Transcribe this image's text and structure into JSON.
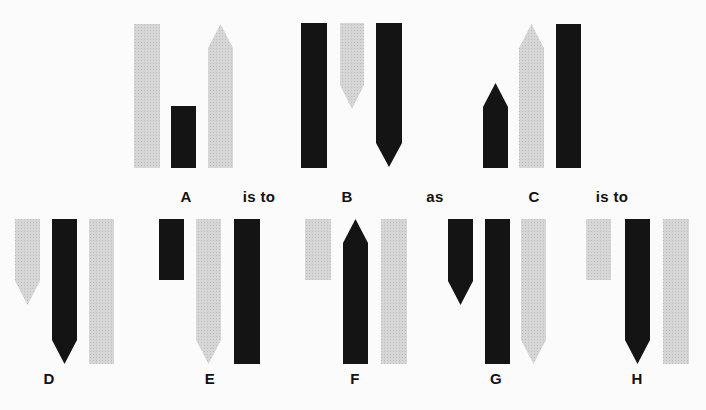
{
  "colors": {
    "dark": "#141414",
    "light": "#d2d2d2",
    "background": "#fbfbfb"
  },
  "puzzle": {
    "type": "visual-analogy",
    "statement": [
      "A",
      "is to",
      "B",
      "as",
      "C",
      "is to"
    ],
    "connectors": {
      "first": "is to",
      "middle": "as",
      "last": "is to"
    },
    "panels": [
      {
        "id": "A",
        "label": "A",
        "row": "question",
        "label_x": 186,
        "label_y": 188,
        "bars": [
          {
            "color": "light",
            "x": 134,
            "w": 26,
            "top": 24,
            "bottom": 168,
            "point": "none"
          },
          {
            "color": "dark",
            "x": 171,
            "w": 25,
            "top": 106,
            "bottom": 168,
            "point": "none"
          },
          {
            "color": "light",
            "x": 208,
            "w": 25,
            "top": 24,
            "bottom": 168,
            "point": "up",
            "point_h": 24
          }
        ]
      },
      {
        "id": "B",
        "label": "B",
        "row": "question",
        "label_x": 347,
        "label_y": 188,
        "bars": [
          {
            "color": "dark",
            "x": 301,
            "w": 26,
            "top": 23,
            "bottom": 168,
            "point": "none"
          },
          {
            "color": "light",
            "x": 340,
            "w": 24,
            "top": 23,
            "bottom": 109,
            "point": "down",
            "point_h": 24
          },
          {
            "color": "dark",
            "x": 376,
            "w": 26,
            "top": 23,
            "bottom": 167,
            "point": "down",
            "point_h": 24
          }
        ]
      },
      {
        "id": "C",
        "label": "C",
        "row": "question",
        "label_x": 534,
        "label_y": 188,
        "bars": [
          {
            "color": "dark",
            "x": 483,
            "w": 25,
            "top": 83,
            "bottom": 168,
            "point": "up",
            "point_h": 24
          },
          {
            "color": "light",
            "x": 519,
            "w": 25,
            "top": 24,
            "bottom": 168,
            "point": "up",
            "point_h": 24
          },
          {
            "color": "dark",
            "x": 556,
            "w": 25,
            "top": 24,
            "bottom": 168,
            "point": "none"
          }
        ]
      },
      {
        "id": "D",
        "label": "D",
        "row": "options",
        "label_x": 49,
        "label_y": 370,
        "bars": [
          {
            "color": "light",
            "x": 15,
            "w": 25,
            "top": 219,
            "bottom": 305,
            "point": "down",
            "point_h": 24
          },
          {
            "color": "dark",
            "x": 52,
            "w": 25,
            "top": 219,
            "bottom": 364,
            "point": "down",
            "point_h": 24
          },
          {
            "color": "light",
            "x": 89,
            "w": 25,
            "top": 219,
            "bottom": 364,
            "point": "none"
          }
        ]
      },
      {
        "id": "E",
        "label": "E",
        "row": "options",
        "label_x": 210,
        "label_y": 370,
        "bars": [
          {
            "color": "dark",
            "x": 159,
            "w": 25,
            "top": 219,
            "bottom": 280,
            "point": "none"
          },
          {
            "color": "light",
            "x": 196,
            "w": 25,
            "top": 219,
            "bottom": 364,
            "point": "down",
            "point_h": 24
          },
          {
            "color": "dark",
            "x": 234,
            "w": 26,
            "top": 219,
            "bottom": 364,
            "point": "none"
          }
        ]
      },
      {
        "id": "F",
        "label": "F",
        "row": "options",
        "label_x": 355,
        "label_y": 370,
        "bars": [
          {
            "color": "light",
            "x": 305,
            "w": 26,
            "top": 219,
            "bottom": 280,
            "point": "none"
          },
          {
            "color": "dark",
            "x": 343,
            "w": 25,
            "top": 219,
            "bottom": 364,
            "point": "up",
            "point_h": 24
          },
          {
            "color": "light",
            "x": 381,
            "w": 26,
            "top": 219,
            "bottom": 364,
            "point": "none"
          }
        ]
      },
      {
        "id": "G",
        "label": "G",
        "row": "options",
        "label_x": 496,
        "label_y": 370,
        "bars": [
          {
            "color": "dark",
            "x": 448,
            "w": 25,
            "top": 219,
            "bottom": 305,
            "point": "down",
            "point_h": 24
          },
          {
            "color": "dark",
            "x": 485,
            "w": 25,
            "top": 219,
            "bottom": 364,
            "point": "none"
          },
          {
            "color": "light",
            "x": 521,
            "w": 25,
            "top": 219,
            "bottom": 364,
            "point": "down",
            "point_h": 24
          }
        ]
      },
      {
        "id": "H",
        "label": "H",
        "row": "options",
        "label_x": 637,
        "label_y": 370,
        "bars": [
          {
            "color": "light",
            "x": 586,
            "w": 25,
            "top": 219,
            "bottom": 280,
            "point": "none"
          },
          {
            "color": "dark",
            "x": 625,
            "w": 25,
            "top": 219,
            "bottom": 364,
            "point": "down",
            "point_h": 24
          },
          {
            "color": "light",
            "x": 663,
            "w": 26,
            "top": 219,
            "bottom": 364,
            "point": "none"
          }
        ]
      }
    ],
    "connector_positions": [
      {
        "key": "first",
        "x": 259,
        "y": 188
      },
      {
        "key": "middle",
        "x": 435,
        "y": 188
      },
      {
        "key": "last",
        "x": 612,
        "y": 188
      }
    ]
  }
}
